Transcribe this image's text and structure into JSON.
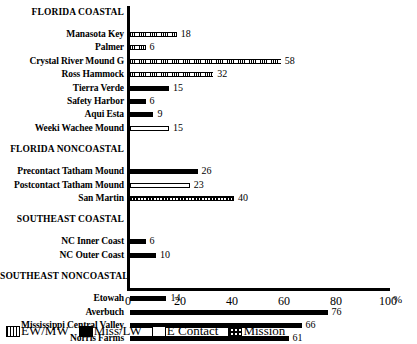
{
  "chart_data": {
    "type": "bar",
    "orientation": "horizontal",
    "title": "",
    "xlabel": "%",
    "ylabel": "",
    "xlim": [
      0,
      100
    ],
    "xticks": [
      0,
      20,
      40,
      60,
      80,
      100
    ],
    "xtick_labels": [
      "0",
      "20",
      "40",
      "60",
      "80",
      "100"
    ],
    "grid": false,
    "legend_position": "bottom",
    "legend": [
      {
        "key": "ewmw",
        "label": "EW/MW",
        "pattern": "vertical-hatch"
      },
      {
        "key": "misslw",
        "label": "Miss/LW",
        "pattern": "solid-black"
      },
      {
        "key": "econtact",
        "label": "E Contact",
        "pattern": "hollow-outline"
      },
      {
        "key": "mission",
        "label": "Mission",
        "pattern": "checkered"
      }
    ],
    "groups": [
      {
        "header": "FLORIDA COASTAL",
        "categories": [
          "Manasota Key",
          "Palmer",
          "Crystal River Mound G",
          "Ross Hammock",
          "Tierra Verde",
          "Safety Harbor",
          "Aqui Esta",
          "Weeki Wachee Mound"
        ],
        "values": [
          18,
          6,
          58,
          32,
          15,
          6,
          9,
          15
        ],
        "series_keys": [
          "ewmw",
          "ewmw",
          "ewmw",
          "ewmw",
          "misslw",
          "misslw",
          "misslw",
          "econtact"
        ]
      },
      {
        "header": "FLORIDA NONCOASTAL",
        "categories": [
          "Precontact Tatham Mound",
          "Postcontact Tatham Mound",
          "San Martin"
        ],
        "values": [
          26,
          23,
          40
        ],
        "series_keys": [
          "misslw",
          "econtact",
          "mission"
        ]
      },
      {
        "header": "SOUTHEAST COASTAL",
        "categories": [
          "NC Inner Coast",
          "NC Outer Coast"
        ],
        "values": [
          6,
          10
        ],
        "series_keys": [
          "misslw",
          "misslw"
        ]
      },
      {
        "header": "SOUTHEAST NONCOASTAL",
        "categories": [
          "Etowah",
          "Averbuch",
          "Mississippi Central Valley",
          "Norris Farms"
        ],
        "values": [
          14,
          76,
          66,
          61
        ],
        "series_keys": [
          "misslw",
          "misslw",
          "misslw",
          "misslw"
        ]
      }
    ]
  },
  "colors": {
    "axis": "#000000",
    "bar_fill": "#000000",
    "background": "#ffffff"
  }
}
